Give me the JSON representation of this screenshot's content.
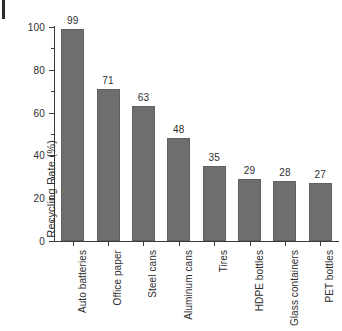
{
  "chart_data": {
    "type": "bar",
    "title": "",
    "subtitle": "",
    "xlabel": "",
    "ylabel": "Recycling Rate (%)",
    "ylim": [
      0,
      100
    ],
    "xlim": [
      0,
      8
    ],
    "grid": false,
    "legend": null,
    "orientation": "vertical",
    "bar_color": "#6e6e6e",
    "axis_color": "#3a3a3a",
    "text_color": "#2e2e2e",
    "background_color": "#ffffff",
    "categories": [
      "Auto batteries",
      "Office paper",
      "Steel cans",
      "Aluminum cans",
      "Tires",
      "HDPE bottles",
      "Glass containers",
      "PET bottles"
    ],
    "values": [
      99,
      71,
      63,
      48,
      35,
      29,
      28,
      27
    ],
    "value_labels": [
      "99",
      "71",
      "63",
      "48",
      "35",
      "29",
      "28",
      "27"
    ],
    "y_ticks": [
      0,
      20,
      40,
      60,
      80,
      100
    ],
    "y_tick_labels": [
      "0",
      "20",
      "40",
      "60",
      "80",
      "100"
    ],
    "y_minor_ticks": [
      10,
      30,
      50,
      70,
      90
    ],
    "tick_direction": "out",
    "annotations": []
  },
  "artifacts": {
    "scan_mark_label": "scan-edge-mark"
  }
}
